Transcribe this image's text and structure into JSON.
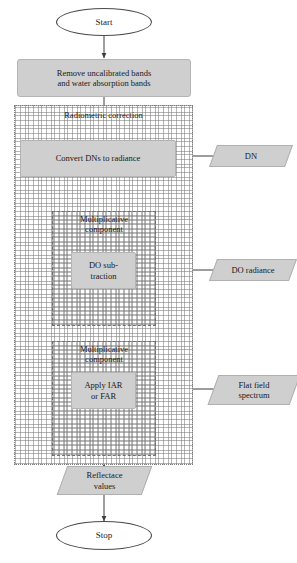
{
  "diagram": {
    "colors": {
      "process_fill": "#cfcfcf",
      "process_stroke": "#b4b4b4",
      "terminal_stroke": "#4a4a4a",
      "connector": "#4a4a4a",
      "hatch": "#787878",
      "background": "#ffffff"
    }
  },
  "nodes": {
    "start": {
      "label": "Start",
      "shape": "ellipse"
    },
    "remove_bands": {
      "line1": "Remove uncalibrated bands",
      "line2": "and water absorption bands",
      "shape": "process"
    },
    "radiometric_group": {
      "caption": "Radiometric correction",
      "shape": "group"
    },
    "convert_dns": {
      "label": "Convert DNs to radiance",
      "shape": "process"
    },
    "dn_input": {
      "label": "DN",
      "shape": "data"
    },
    "mult_group_1": {
      "caption_line1": "Multiplicative",
      "caption_line2": "component",
      "shape": "group"
    },
    "do_subtraction": {
      "line1": "DO sub-",
      "line2": "traction",
      "shape": "process"
    },
    "do_radiance_input": {
      "label": "DO radiance",
      "shape": "data"
    },
    "mult_group_2": {
      "caption_line1": "Multiplicative",
      "caption_line2": "component",
      "shape": "group"
    },
    "apply_iar_far": {
      "line1": "Apply IAR",
      "line2": "or FAR",
      "shape": "process"
    },
    "flat_field_input": {
      "line1": "Flat field",
      "line2": "spectrum",
      "shape": "data"
    },
    "reflectance_values": {
      "line1": "Reflectace",
      "line2": "values",
      "shape": "data"
    },
    "stop": {
      "label": "Stop",
      "shape": "ellipse"
    }
  }
}
